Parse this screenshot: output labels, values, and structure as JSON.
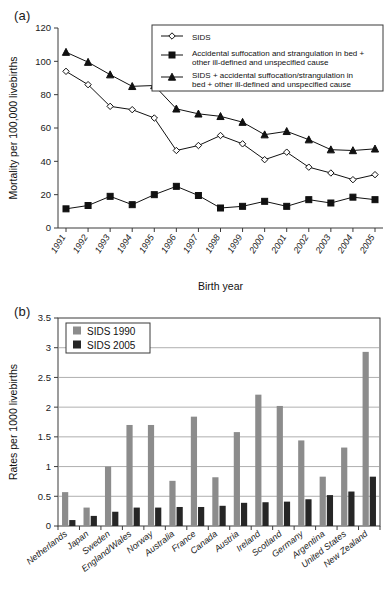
{
  "figure": {
    "panel_a_label": "(a)",
    "panel_b_label": "(b)"
  },
  "chart_data": [
    {
      "id": "panel-a",
      "type": "line",
      "title": "",
      "xlabel": "Birth year",
      "ylabel": "Mortality per 100,000 livebirths",
      "ylim": [
        0,
        120
      ],
      "yticks": [
        0,
        20,
        40,
        60,
        80,
        100,
        120
      ],
      "ytick_labels": [
        "0",
        "20",
        "40",
        "60",
        "80",
        "100",
        "120"
      ],
      "grid": false,
      "legend_position": "top-right",
      "categories": [
        "1991",
        "1992",
        "1993",
        "1994",
        "1995",
        "1996",
        "1997",
        "1998",
        "1999",
        "2000",
        "2001",
        "2002",
        "2003",
        "2004",
        "2005"
      ],
      "series": [
        {
          "name": "SIDS",
          "marker": "open-diamond",
          "values": [
            94.0,
            86.0,
            73.0,
            71.0,
            66.0,
            46.5,
            49.5,
            55.5,
            50.5,
            41.0,
            45.5,
            36.5,
            33.0,
            29.0,
            32.0
          ]
        },
        {
          "name": "Accidental suffocation and strangulation in bed + other ill-defined and unspecified cause",
          "marker": "solid-square",
          "values": [
            11.5,
            13.5,
            19.0,
            14.0,
            20.0,
            25.0,
            19.5,
            12.0,
            13.0,
            16.0,
            13.0,
            17.0,
            15.0,
            18.5,
            17.0
          ]
        },
        {
          "name": "SIDS + accidental suffocation/strangulation in bed + other ill-defined and unspecified cause",
          "marker": "solid-triangle",
          "values": [
            105.5,
            99.5,
            92.0,
            85.0,
            85.5,
            71.5,
            68.5,
            67.0,
            63.5,
            56.0,
            58.0,
            53.0,
            47.0,
            46.5,
            47.5
          ]
        }
      ],
      "legend": [
        {
          "label": "SIDS",
          "marker": "open-diamond"
        },
        {
          "label": "Accidental suffocation and strangulation in bed + other ill-defined and unspecified cause",
          "marker": "solid-square"
        },
        {
          "label": "SIDS + accidental suffocation/strangulation in bed + other ill-defined and unspecified cause",
          "marker": "solid-triangle"
        }
      ]
    },
    {
      "id": "panel-b",
      "type": "bar",
      "title": "",
      "xlabel": "",
      "ylabel": "Rates per 1000 livebirths",
      "ylim": [
        0,
        3.5
      ],
      "yticks": [
        0,
        0.5,
        1,
        1.5,
        2,
        2.5,
        3,
        3.5
      ],
      "ytick_labels": [
        "0",
        "0.5",
        "1",
        "1.5",
        "2",
        "2.5",
        "3",
        "3.5"
      ],
      "grid": true,
      "legend_position": "top-left",
      "categories": [
        "Netherlands",
        "Japan",
        "Sweden",
        "England/Wales",
        "Norway",
        "Australia",
        "France",
        "Canada",
        "Austria",
        "Ireland",
        "Scotland",
        "Germany",
        "Argentina",
        "United States",
        "New Zealand"
      ],
      "series": [
        {
          "name": "SIDS 1990",
          "color": "#8c8c8c",
          "values": [
            0.57,
            0.31,
            1.0,
            1.7,
            1.7,
            0.76,
            1.84,
            0.82,
            1.58,
            2.21,
            2.02,
            1.44,
            0.83,
            1.32,
            2.93
          ]
        },
        {
          "name": "SIDS 2005",
          "color": "#262626",
          "values": [
            0.1,
            0.17,
            0.24,
            0.31,
            0.31,
            0.32,
            0.32,
            0.34,
            0.39,
            0.4,
            0.41,
            0.45,
            0.52,
            0.58,
            0.83
          ]
        }
      ],
      "legend": [
        {
          "label": "SIDS 1990",
          "color": "#8c8c8c"
        },
        {
          "label": "SIDS 2005",
          "color": "#262626"
        }
      ]
    }
  ]
}
